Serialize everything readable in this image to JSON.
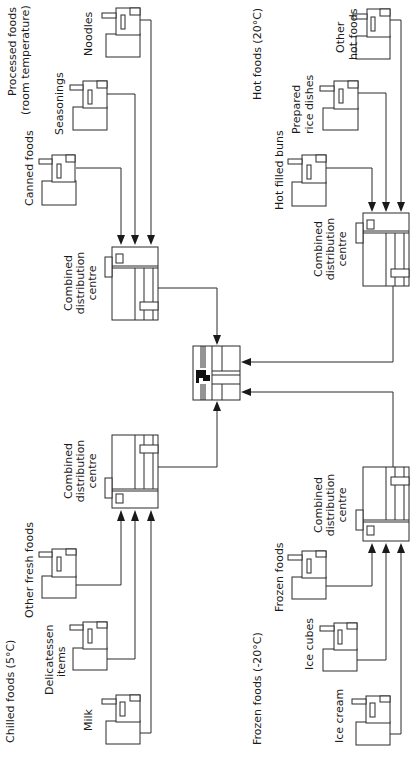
{
  "diagram": {
    "orientation": "rotated-90-ccw",
    "groups": [
      {
        "id": "processed",
        "title_line1": "Processed foods",
        "title_line2": "(room temperature)",
        "factories": [
          "Canned foods",
          "Seasonings",
          "Noodles"
        ],
        "distribution_centre": [
          "Combined",
          "distribution",
          "centre"
        ]
      },
      {
        "id": "hot",
        "title": "Hot foods (20°C)",
        "factories": [
          "Hot filled buns",
          "Prepared rice dishes",
          "Other hot foods"
        ],
        "factory_label_lines": {
          "rice": [
            "Prepared",
            "rice dishes"
          ],
          "other": [
            "Other",
            "hot foods"
          ]
        },
        "distribution_centre": [
          "Combined",
          "distribution",
          "centre"
        ]
      },
      {
        "id": "chilled",
        "title": "Chilled foods (5°C)",
        "factories": [
          "Other fresh foods",
          "Delicatessen items",
          "Milk"
        ],
        "factory_label_lines": {
          "deli": [
            "Delicatessen",
            "items"
          ]
        },
        "distribution_centre": [
          "Combined",
          "distribution",
          "centre"
        ]
      },
      {
        "id": "frozen",
        "title": "Frozen foods (-20°C)",
        "factories": [
          "Frozen foods",
          "Ice cubes",
          "Ice cream"
        ],
        "distribution_centre": [
          "Combined",
          "distribution",
          "centre"
        ]
      }
    ],
    "central_node": "convenience-store",
    "colors": {
      "line": "#2a2a2a",
      "text": "#1a1a1a",
      "background": "#ffffff"
    }
  }
}
